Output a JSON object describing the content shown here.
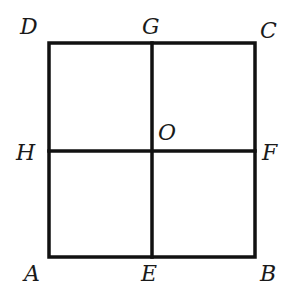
{
  "diagram": {
    "type": "square subdivided into four equal squares",
    "square": {
      "x1": 48,
      "y1": 42,
      "x2": 256,
      "y2": 258
    },
    "center": {
      "x": 152,
      "y": 151
    },
    "stroke_color": "#111111",
    "stroke_width": 3.5,
    "labels": {
      "D": "D",
      "G": "G",
      "C": "C",
      "H": "H",
      "O": "O",
      "F": "F",
      "A": "A",
      "E": "E",
      "B": "B"
    },
    "segments": [
      {
        "name": "AB",
        "from": "A",
        "to": "B"
      },
      {
        "name": "BC",
        "from": "B",
        "to": "C"
      },
      {
        "name": "CD",
        "from": "C",
        "to": "D"
      },
      {
        "name": "DA",
        "from": "D",
        "to": "A"
      },
      {
        "name": "GE",
        "from": "G",
        "to": "E"
      },
      {
        "name": "HF",
        "from": "H",
        "to": "F"
      }
    ]
  }
}
